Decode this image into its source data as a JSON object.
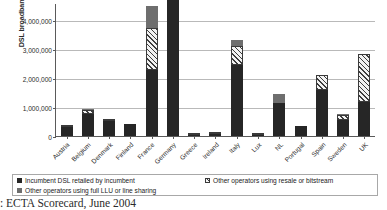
{
  "chart_data": {
    "type": "bar",
    "stacked": true,
    "title": "",
    "xlabel": "",
    "ylabel": "DSL broadband subscribers",
    "ylim": [
      0,
      4600000
    ],
    "yticks": [
      0,
      1000000,
      2000000,
      3000000,
      4000000
    ],
    "ytick_labels": [
      "0",
      "1,000,000",
      "2,000,000",
      "3,000,000",
      "4,000,000"
    ],
    "grid": true,
    "legend_position": "bottom",
    "categories": [
      "Austria",
      "Belgium",
      "Denmark",
      "Finland",
      "France",
      "Germany",
      "Greece",
      "Ireland",
      "Italy",
      "Lux",
      "NL",
      "Portugal",
      "Spain",
      "Sweden",
      "UK"
    ],
    "series": [
      {
        "name": "Incumbent DSL retailed by incumbent",
        "color": "#262626",
        "values": [
          310000,
          760000,
          520000,
          420000,
          2280000,
          4700000,
          45000,
          80000,
          2450000,
          40000,
          1150000,
          340000,
          1590000,
          560000,
          1170000
        ]
      },
      {
        "name": "Other operators using full LLU or line sharing",
        "color": "#6e6e6e",
        "values": [
          0,
          20000,
          0,
          0,
          750000,
          100000,
          0,
          0,
          230000,
          0,
          300000,
          0,
          10000,
          10000,
          0
        ]
      },
      {
        "name": "Other operators using resale or bitstream",
        "color": "#f2f2f2",
        "pattern": "hatched",
        "values": [
          60000,
          150000,
          60000,
          0,
          1470000,
          0,
          5000,
          10000,
          650000,
          5000,
          0,
          0,
          510000,
          180000,
          1680000
        ]
      }
    ],
    "totals": [
      370000,
      930000,
      580000,
      420000,
      4500000,
      4800000,
      50000,
      90000,
      3330000,
      45000,
      1450000,
      340000,
      2110000,
      750000,
      2850000
    ]
  },
  "legend": {
    "items": [
      {
        "label": "Incumbent DSL retailed by incumbent",
        "swatch": "incumbent-swatch"
      },
      {
        "label": "Other operators using full LLU or line sharing",
        "swatch": "llu-swatch"
      },
      {
        "label": "Other operators using resale or bitstream",
        "swatch": "resale-swatch"
      }
    ]
  },
  "caption": {
    "text": ": ECTA Scorecard, June 2004"
  },
  "colors": {
    "incumbent": "#262626",
    "llu": "#6e6e6e",
    "resale": "#f2f2f2",
    "axis": "#5a5a5a",
    "grid": "#b9b9b9"
  }
}
